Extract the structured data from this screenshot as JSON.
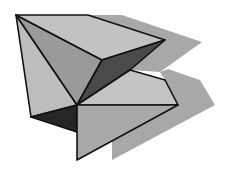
{
  "figure": {
    "colors": {
      "background": "#ffffff",
      "shadow": "#a8a8a8",
      "face_light": "#bdbdbd",
      "face_mid": "#a9a9a9",
      "face_mid_dark": "#8f8f8f",
      "face_dark": "#4a4a4a",
      "face_darkest": "#262626",
      "edge": "#111111"
    }
  }
}
